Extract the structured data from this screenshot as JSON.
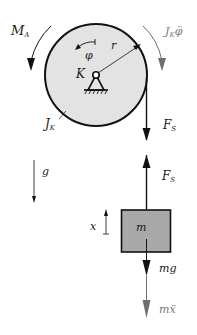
{
  "diagram": {
    "colors": {
      "disk_fill": "#e3e3e3",
      "block_fill": "#a9a9a9",
      "stroke": "#111111",
      "inertial": "#6e6e6e"
    },
    "disk": {
      "center_label": "K",
      "radius_label": "r",
      "angle_label": "φ",
      "inertia_label": {
        "main": "J",
        "sub": "K"
      }
    },
    "moments": {
      "applied": {
        "main": "M",
        "sub": "A"
      },
      "inertial": {
        "main": "J",
        "sub": "K",
        "suffix": "φ̈"
      }
    },
    "rope_force_top": {
      "main": "F",
      "sub": "S"
    },
    "rope_force_bottom": {
      "main": "F",
      "sub": "S"
    },
    "gravity_label": "g",
    "coordinate_label": "x",
    "mass": {
      "label": "m",
      "weight_label": "mg",
      "inertial_label": "mẍ"
    }
  }
}
